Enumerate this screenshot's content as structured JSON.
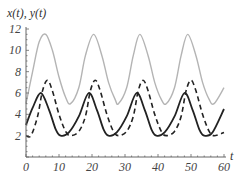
{
  "chart_data": {
    "type": "line",
    "title": "",
    "ylabel": "x(t), y(t)",
    "xlabel": "t",
    "xlim": [
      0,
      60
    ],
    "ylim": [
      0,
      12
    ],
    "x_ticks": [
      "0",
      "10",
      "20",
      "30",
      "40",
      "50",
      "60"
    ],
    "y_ticks": [
      "2",
      "4",
      "6",
      "8",
      "10",
      "12"
    ],
    "grid": false,
    "legend": null,
    "series": [
      {
        "name": "x(t)",
        "style": "solid",
        "color": "#222222",
        "x": [
          0,
          2,
          4.5,
          7,
          9,
          10.5,
          13,
          16,
          19,
          21.5,
          23.5,
          25,
          27.5,
          30.5,
          33.5,
          36,
          38,
          39.5,
          42,
          45,
          48,
          50.5,
          52.5,
          54,
          56.5,
          60
        ],
        "values": [
          3,
          4.6,
          6,
          4.4,
          2.6,
          2,
          2.3,
          3.8,
          6,
          4.4,
          2.6,
          2,
          2.3,
          3.8,
          6,
          4.4,
          2.6,
          2,
          2.3,
          3.8,
          6,
          4.4,
          2.6,
          2,
          2.3,
          4.5
        ]
      },
      {
        "name": "y(t)",
        "style": "dashed",
        "color": "#222222",
        "x": [
          0,
          1.5,
          3.5,
          5,
          6.5,
          8,
          10,
          12,
          13.5,
          16,
          18,
          19.5,
          21,
          22.5,
          24.5,
          26.5,
          28,
          30.5,
          32.5,
          34,
          35.5,
          37,
          39,
          41,
          42.5,
          45,
          47,
          48.5,
          50,
          51.5,
          53.5,
          55.5,
          57,
          60
        ],
        "values": [
          2,
          2,
          3.8,
          6.2,
          7.2,
          6.2,
          4,
          2.4,
          2,
          2.4,
          3.8,
          6.2,
          7.2,
          6.2,
          4,
          2.4,
          2,
          2.4,
          3.8,
          6.2,
          7.2,
          6.2,
          4,
          2.4,
          2,
          2.4,
          3.8,
          6.2,
          7.2,
          6.2,
          4,
          2.4,
          2,
          2.3
        ]
      },
      {
        "name": "x(t)+y(t)",
        "style": "solid",
        "color": "#b4b4b4",
        "x": [
          0,
          2,
          4,
          6,
          8,
          10,
          12,
          13.5,
          16,
          18,
          20.5,
          23,
          25,
          27,
          28,
          30.5,
          32.5,
          34.5,
          37,
          39,
          41,
          42.5,
          45,
          47,
          49,
          51.5,
          53.5,
          55.5,
          57,
          60
        ],
        "values": [
          5,
          8,
          10.8,
          11.5,
          10,
          7.5,
          5.6,
          5,
          6.5,
          9.5,
          11.5,
          9.5,
          7,
          5.4,
          5,
          6.5,
          9.5,
          11.5,
          9.5,
          7,
          5.4,
          5,
          6.5,
          9.5,
          11.5,
          9.5,
          7,
          5.4,
          5,
          6.5
        ]
      }
    ]
  }
}
